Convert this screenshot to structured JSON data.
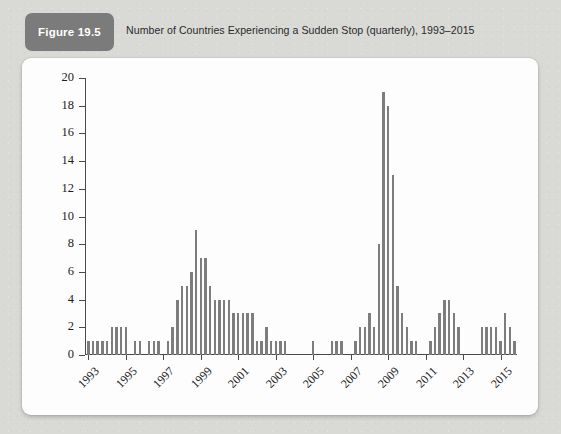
{
  "figure": {
    "badge_label": "Figure 19.5",
    "caption": "Number of Countries Experiencing a Sudden Stop (quarterly), 1993–2015",
    "badge_color": "#7b7b7b",
    "card_color": "#fdfdfd",
    "page_background": "#d9d9d6",
    "bar_color": "#7d7d7d",
    "axis_color": "#4a4a4a"
  },
  "chart_data": {
    "type": "bar",
    "title": "Number of Countries Experiencing a Sudden Stop (quarterly), 1993–2015",
    "xlabel": "",
    "ylabel": "",
    "ylim": [
      0,
      20
    ],
    "ytick_labels": [
      "0",
      "2",
      "4",
      "6",
      "8",
      "10",
      "12",
      "14",
      "16",
      "18",
      "20"
    ],
    "yticks": [
      0,
      2,
      4,
      6,
      8,
      10,
      12,
      14,
      16,
      18,
      20
    ],
    "xtick_labels": [
      "1993",
      "1995",
      "1997",
      "1999",
      "2001",
      "2003",
      "2005",
      "2007",
      "2009",
      "2011",
      "2013",
      "2015"
    ],
    "xticks_quarter_index": [
      0,
      8,
      16,
      24,
      32,
      40,
      48,
      56,
      64,
      72,
      80,
      88
    ],
    "grid": false,
    "legend": null,
    "frequency": "quarterly",
    "categories": [
      "1993Q1",
      "1993Q2",
      "1993Q3",
      "1993Q4",
      "1994Q1",
      "1994Q2",
      "1994Q3",
      "1994Q4",
      "1995Q1",
      "1995Q2",
      "1995Q3",
      "1995Q4",
      "1996Q1",
      "1996Q2",
      "1996Q3",
      "1996Q4",
      "1997Q1",
      "1997Q2",
      "1997Q3",
      "1997Q4",
      "1998Q1",
      "1998Q2",
      "1998Q3",
      "1998Q4",
      "1999Q1",
      "1999Q2",
      "1999Q3",
      "1999Q4",
      "2000Q1",
      "2000Q2",
      "2000Q3",
      "2000Q4",
      "2001Q1",
      "2001Q2",
      "2001Q3",
      "2001Q4",
      "2002Q1",
      "2002Q2",
      "2002Q3",
      "2002Q4",
      "2003Q1",
      "2003Q2",
      "2003Q3",
      "2003Q4",
      "2004Q1",
      "2004Q2",
      "2004Q3",
      "2004Q4",
      "2005Q1",
      "2005Q2",
      "2005Q3",
      "2005Q4",
      "2006Q1",
      "2006Q2",
      "2006Q3",
      "2006Q4",
      "2007Q1",
      "2007Q2",
      "2007Q3",
      "2007Q4",
      "2008Q1",
      "2008Q2",
      "2008Q3",
      "2008Q4",
      "2009Q1",
      "2009Q2",
      "2009Q3",
      "2009Q4",
      "2010Q1",
      "2010Q2",
      "2010Q3",
      "2010Q4",
      "2011Q1",
      "2011Q2",
      "2011Q3",
      "2011Q4",
      "2012Q1",
      "2012Q2",
      "2012Q3",
      "2012Q4",
      "2013Q1",
      "2013Q2",
      "2013Q3",
      "2013Q4",
      "2014Q1",
      "2014Q2",
      "2014Q3",
      "2014Q4",
      "2015Q1",
      "2015Q2",
      "2015Q3",
      "2015Q4"
    ],
    "values": [
      1,
      1,
      1,
      1,
      1,
      2,
      2,
      2,
      2,
      0,
      1,
      1,
      0,
      1,
      1,
      1,
      0,
      1,
      2,
      4,
      5,
      5,
      6,
      9,
      7,
      7,
      5,
      4,
      4,
      4,
      4,
      3,
      3,
      3,
      3,
      3,
      1,
      1,
      2,
      1,
      1,
      1,
      1,
      0,
      0,
      0,
      0,
      0,
      1,
      0,
      0,
      0,
      1,
      1,
      1,
      0,
      0,
      1,
      2,
      2,
      3,
      2,
      8,
      19,
      18,
      13,
      5,
      3,
      2,
      1,
      1,
      0,
      0,
      1,
      2,
      3,
      4,
      4,
      3,
      2,
      0,
      0,
      0,
      0,
      2,
      2,
      2,
      2,
      1,
      3,
      2,
      1
    ]
  }
}
